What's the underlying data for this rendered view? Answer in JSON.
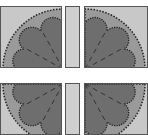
{
  "figure": {
    "colors": {
      "background": "#ffffff",
      "tile": "#c8c8c8",
      "outer_ring": "#9a9a9a",
      "inner_lobes": "#6e6e6e",
      "outline": "#222222",
      "strip": "#cfcfcf"
    },
    "tiles": [
      {
        "position": "top-left",
        "corner": "bottom-right"
      },
      {
        "position": "top-right",
        "corner": "bottom-left"
      },
      {
        "position": "bottom-left",
        "corner": "top-right"
      },
      {
        "position": "bottom-right",
        "corner": "top-left"
      }
    ]
  }
}
